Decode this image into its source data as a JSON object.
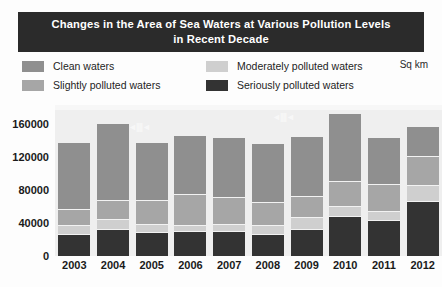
{
  "title": {
    "line1": "Changes in the Area of Sea Waters at Various Pollution Levels",
    "line2": "in Recent Decade",
    "banner_color": "#2b2b2b",
    "text_color": "#ffffff"
  },
  "legend": {
    "unit": "Sq km",
    "items": [
      {
        "label": "Clean waters",
        "color": "#8f8f8f",
        "key": "clean"
      },
      {
        "label": "Slightly polluted waters",
        "color": "#a6a6a6",
        "key": "slightly"
      },
      {
        "label": "Moderately polluted waters",
        "color": "#cfcfcf",
        "key": "moderately"
      },
      {
        "label": "Seriously polluted waters",
        "color": "#333333",
        "key": "seriously"
      }
    ]
  },
  "chart_data": {
    "type": "bar",
    "subtype": "stacked-vertical",
    "title": "Changes in the Area of Sea Waters at Various Pollution Levels in Recent Decade",
    "xlabel": "",
    "ylabel": "Sq km",
    "ylim": [
      0,
      180000
    ],
    "yticks": [
      0,
      40000,
      80000,
      120000,
      160000
    ],
    "ytick_labels": [
      "0",
      "40000",
      "80000",
      "120000",
      "160000"
    ],
    "grid": false,
    "legend_position": "top",
    "categories": [
      "2003",
      "2004",
      "2005",
      "2006",
      "2007",
      "2008",
      "2009",
      "2010",
      "2011",
      "2012"
    ],
    "series": [
      {
        "name": "Seriously polluted waters",
        "color": "#333333",
        "values": [
          25000,
          32000,
          28000,
          29000,
          29000,
          26000,
          32000,
          47000,
          43000,
          66000
        ]
      },
      {
        "name": "Moderately polluted waters",
        "color": "#cfcfcf",
        "values": [
          11000,
          12000,
          10000,
          8000,
          9000,
          10000,
          14000,
          13000,
          10000,
          19000
        ]
      },
      {
        "name": "Slightly polluted waters",
        "color": "#a6a6a6",
        "values": [
          20000,
          23000,
          29000,
          37000,
          32000,
          29000,
          26000,
          30000,
          33000,
          36000
        ]
      },
      {
        "name": "Clean waters",
        "color": "#8f8f8f",
        "values": [
          82000,
          93000,
          70000,
          72000,
          73000,
          71000,
          73000,
          83000,
          57000,
          36000
        ]
      }
    ],
    "totals": [
      138000,
      160000,
      137000,
      146000,
      143000,
      136000,
      145000,
      173000,
      143000,
      157000
    ]
  },
  "artifacts": {
    "mark1": "◄||||◄",
    "mark2": "◄||||◄"
  }
}
